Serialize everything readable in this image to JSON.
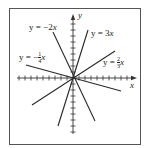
{
  "chart_data": {
    "type": "line",
    "title": "",
    "xlabel": "x",
    "ylabel": "y",
    "grid": false,
    "series": [
      {
        "name": "y = -2x",
        "slope": -2
      },
      {
        "name": "y = 3x",
        "slope": 3
      },
      {
        "name": "y = -1/4 x",
        "slope": -0.25
      },
      {
        "name": "y = 2/3 x",
        "slope": 0.6667
      }
    ]
  },
  "axes": {
    "x_label": "x",
    "y_label": "y"
  },
  "labels": {
    "l1": {
      "pre": "y = −2",
      "var": "x"
    },
    "l2": {
      "pre": "y = 3",
      "var": "x"
    },
    "l3": {
      "pre": "y = −",
      "num": "1",
      "den": "4",
      "var": "x"
    },
    "l4": {
      "pre": "y = ",
      "num": "2",
      "den": "3",
      "var": "x"
    }
  },
  "colors": {
    "line": "#2a2a2a",
    "frame": "#555555"
  }
}
